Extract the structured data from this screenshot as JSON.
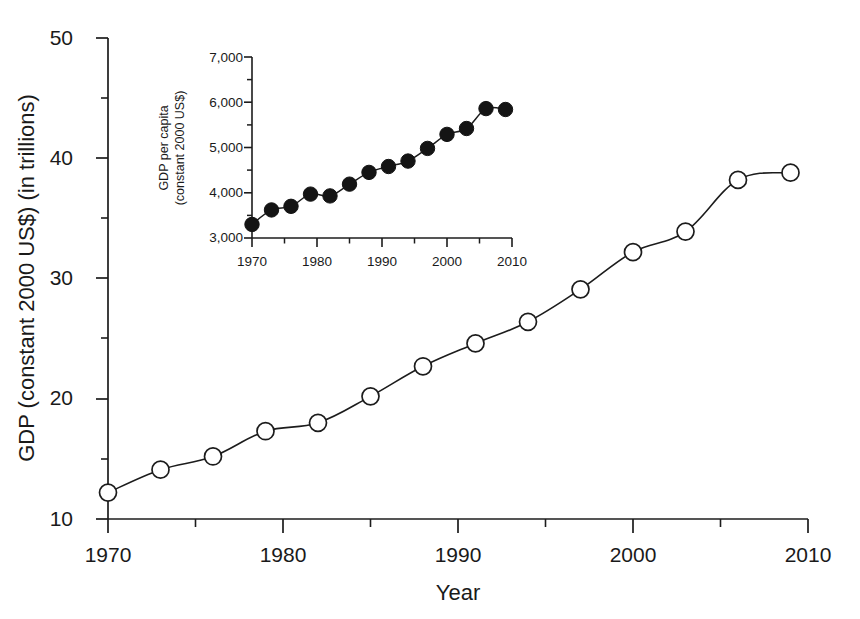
{
  "chart_data": [
    {
      "id": "main",
      "type": "line",
      "title": "",
      "xlabel": "Year",
      "ylabel": "GDP (constant 2000 US$) (in trillions)",
      "xlim": [
        1970,
        2010
      ],
      "ylim": [
        10,
        50
      ],
      "xticks": [
        1970,
        1980,
        1990,
        2000,
        2010
      ],
      "xtick_labels": [
        "1970",
        "1980",
        "1990",
        "2000",
        "2010"
      ],
      "xminor_ticks": [
        1975,
        1985,
        1995,
        2005
      ],
      "yticks": [
        10,
        20,
        30,
        40,
        50
      ],
      "ytick_labels": [
        "10",
        "20",
        "30",
        "40",
        "50"
      ],
      "yminor_ticks": [
        15,
        25,
        35,
        45
      ],
      "grid": false,
      "legend": "none",
      "marker": "open-circle",
      "x": [
        1970,
        1973,
        1976,
        1979,
        1982,
        1985,
        1988,
        1991,
        1994,
        1997,
        2000,
        2003,
        2006,
        2009
      ],
      "values": [
        12.2,
        14.1,
        15.2,
        17.3,
        18.0,
        20.2,
        22.7,
        24.6,
        26.4,
        29.1,
        32.2,
        33.9,
        38.2,
        38.8
      ],
      "peak_note": "curve peaks near 2008 at about 39.9 before the final 2009 point"
    },
    {
      "id": "inset",
      "type": "line",
      "title": "",
      "xlabel": "",
      "ylabel": "GDP per capita (constant 2000 US$)",
      "ylabel_line1": "GDP per capita",
      "ylabel_line2": "(constant 2000 US$)",
      "xlim": [
        1970,
        2010
      ],
      "ylim": [
        3000,
        7000
      ],
      "xticks": [
        1970,
        1980,
        1990,
        2000,
        2010
      ],
      "xtick_labels": [
        "1970",
        "1980",
        "1990",
        "2000",
        "2010"
      ],
      "xminor_ticks": [
        1975,
        1985,
        1995,
        2005
      ],
      "yticks": [
        3000,
        4000,
        5000,
        6000,
        7000
      ],
      "ytick_labels": [
        "3,000",
        "4,000",
        "5,000",
        "6,000",
        "7,000"
      ],
      "yminor_ticks": [
        3500,
        4500,
        5500,
        6500
      ],
      "grid": false,
      "legend": "none",
      "marker": "filled-circle",
      "x": [
        1970,
        1973,
        1976,
        1979,
        1982,
        1985,
        1988,
        1991,
        1994,
        1997,
        2000,
        2003,
        2006,
        2009
      ],
      "values": [
        3300,
        3620,
        3700,
        3970,
        3930,
        4190,
        4450,
        4580,
        4700,
        4980,
        5290,
        5420,
        5860,
        5840
      ]
    }
  ],
  "colors": {
    "ink": "#1c1c1c",
    "marker_fill_open": "#ffffff",
    "marker_fill_solid": "#141414",
    "background": "#ffffff"
  }
}
